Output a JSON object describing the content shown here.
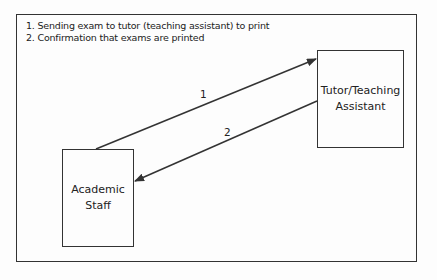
{
  "legend": {
    "items": [
      {
        "num": "1.",
        "text": "Sending exam to tutor (teaching assistant) to print"
      },
      {
        "num": "2.",
        "text": "Confirmation that exams are printed"
      }
    ]
  },
  "nodes": {
    "tutor": {
      "line1": "Tutor/Teaching",
      "line2": "Assistant"
    },
    "staff": {
      "line1": "Academic",
      "line2": "Staff"
    }
  },
  "edges": [
    {
      "label": "1",
      "from": "Academic Staff",
      "to": "Tutor/Teaching Assistant"
    },
    {
      "label": "2",
      "from": "Tutor/Teaching Assistant",
      "to": "Academic Staff"
    }
  ],
  "colors": {
    "stroke": "#333333",
    "background": "#fdfdfd"
  }
}
